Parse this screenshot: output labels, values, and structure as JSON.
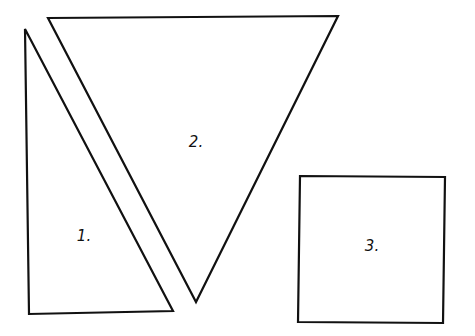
{
  "diagram": {
    "background": "#ffffff",
    "stroke_color": "#111111",
    "shapes": [
      {
        "id": "1",
        "type": "triangle",
        "label": "1.",
        "points": "25,29 173,311 29,314",
        "label_pos": {
          "x": 84,
          "y": 236
        }
      },
      {
        "id": "2",
        "type": "triangle",
        "label": "2.",
        "points": "48,18 338,16 196,302",
        "label_pos": {
          "x": 196,
          "y": 142
        }
      },
      {
        "id": "3",
        "type": "square",
        "label": "3.",
        "points": "300,176 445,177 443,323 298,322",
        "label_pos": {
          "x": 372,
          "y": 246
        }
      }
    ]
  }
}
